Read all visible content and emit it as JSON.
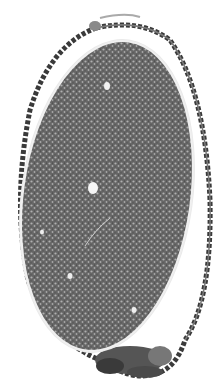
{
  "image": {
    "subject": "nerve cross-section micrograph",
    "width": 223,
    "height": 392,
    "background": "#ffffff",
    "colors": {
      "fascicle_fill": "#7d7d7d",
      "fascicle_dark": "#4a4a4a",
      "perineurium": "#2e2e2e",
      "inner_rim": "#e8e8e8",
      "axon_light": "#d9d9d9",
      "vessel": "#f4f4f4",
      "epineurium": "#5a5a5a"
    }
  }
}
